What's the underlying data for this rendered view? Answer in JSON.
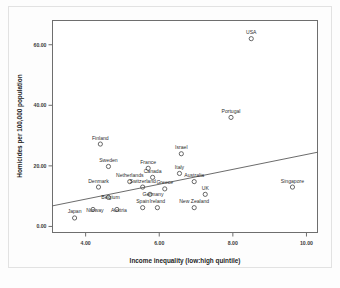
{
  "chart_data": {
    "type": "scatter",
    "title": "",
    "xlabel": "Income inequality (low:high quintile)",
    "ylabel": "Homicides per 100,000 population",
    "xlim": [
      3.1,
      10.3
    ],
    "ylim": [
      -2.0,
      68.0
    ],
    "xticks": [
      "4.00",
      "6.00",
      "8.00",
      "10.00"
    ],
    "xtick_values": [
      4,
      6,
      8,
      10
    ],
    "yticks": [
      "0.00",
      "20.00",
      "40.00",
      "60.00"
    ],
    "ytick_values": [
      0,
      20,
      40,
      60
    ],
    "grid": false,
    "legend": "none",
    "marker": "open-circle",
    "points": [
      {
        "label": "USA",
        "x": 8.5,
        "y": 62.0,
        "label_dx": 0,
        "label_dy": -4.5
      },
      {
        "label": "Portugal",
        "x": 7.95,
        "y": 36.0,
        "label_dx": 0,
        "label_dy": -4.5
      },
      {
        "label": "Finland",
        "x": 4.4,
        "y": 27.2,
        "label_dx": 0,
        "label_dy": -4.5
      },
      {
        "label": "Israel",
        "x": 6.6,
        "y": 24.0,
        "label_dx": 0,
        "label_dy": -4.5
      },
      {
        "label": "Sweden",
        "x": 4.62,
        "y": 19.8,
        "label_dx": 0,
        "label_dy": -4.5
      },
      {
        "label": "France",
        "x": 5.7,
        "y": 19.2,
        "label_dx": 0,
        "label_dy": -4.5
      },
      {
        "label": "Canada",
        "x": 5.82,
        "y": 16.2,
        "label_dx": 0,
        "label_dy": -4.5
      },
      {
        "label": "Denmark",
        "x": 4.35,
        "y": 13.0,
        "label_dx": 0,
        "label_dy": -4.5
      },
      {
        "label": "Netherlands",
        "x": 5.2,
        "y": 14.8,
        "label_dx": 0,
        "label_dy": -4.5
      },
      {
        "label": "Switzerland",
        "x": 5.55,
        "y": 13.0,
        "label_dx": 0,
        "label_dy": -4.5
      },
      {
        "label": "Italy",
        "x": 6.55,
        "y": 17.5,
        "label_dx": 0,
        "label_dy": -4.5
      },
      {
        "label": "Australia",
        "x": 6.95,
        "y": 14.8,
        "label_dx": 0,
        "label_dy": -4.5
      },
      {
        "label": "Greece",
        "x": 6.15,
        "y": 12.4,
        "label_dx": 0,
        "label_dy": -4.5
      },
      {
        "label": "Germany",
        "x": 5.75,
        "y": 10.6,
        "label_dx": 3,
        "label_dy": 1.6
      },
      {
        "label": "Belgium",
        "x": 4.62,
        "y": 9.6,
        "label_dx": 2,
        "label_dy": 2.0
      },
      {
        "label": "UK",
        "x": 7.25,
        "y": 10.6,
        "label_dx": 0,
        "label_dy": -4.5
      },
      {
        "label": "Singapore",
        "x": 9.62,
        "y": 13.0,
        "label_dx": 0,
        "label_dy": -4.5
      },
      {
        "label": "Spain",
        "x": 5.55,
        "y": 6.2,
        "label_dx": 0,
        "label_dy": -4.5
      },
      {
        "label": "Ireland",
        "x": 5.95,
        "y": 6.2,
        "label_dx": 0,
        "label_dy": -4.5
      },
      {
        "label": "New Zealand",
        "x": 6.95,
        "y": 6.2,
        "label_dx": 0,
        "label_dy": -4.5
      },
      {
        "label": "Japan",
        "x": 3.7,
        "y": 2.8,
        "label_dx": 0,
        "label_dy": -4.5
      },
      {
        "label": "Norway",
        "x": 4.2,
        "y": 5.6,
        "label_dx": 2,
        "label_dy": 2.2
      },
      {
        "label": "Austria",
        "x": 4.85,
        "y": 5.6,
        "label_dx": 2,
        "label_dy": 2.2
      }
    ],
    "fit_line": {
      "x0": 3.1,
      "y0": 6.8,
      "x1": 10.3,
      "y1": 24.5
    }
  }
}
